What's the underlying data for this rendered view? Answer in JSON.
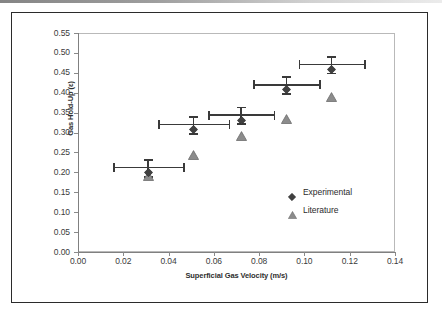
{
  "figure": {
    "frame_color": "#2b2b2b",
    "background": "#ffffff"
  },
  "chart_data": {
    "type": "scatter",
    "title": "",
    "xlabel": "Superficial Gas Velocity (m/s)",
    "ylabel": "Gas Hold-Up (ε)",
    "xlim": [
      0.0,
      0.14
    ],
    "ylim": [
      0.0,
      0.55
    ],
    "xticks": [
      0.0,
      0.02,
      0.04,
      0.06,
      0.08,
      0.1,
      0.12,
      0.14
    ],
    "xtick_labels": [
      "0.00",
      "0.02",
      "0.04",
      "0.06",
      "0.08",
      "0.10",
      "0.12",
      "0.14"
    ],
    "yticks": [
      0.0,
      0.05,
      0.1,
      0.15,
      0.2,
      0.25,
      0.3,
      0.35,
      0.4,
      0.45,
      0.5,
      0.55
    ],
    "ytick_labels": [
      "0.00",
      "0.05",
      "0.10",
      "0.15",
      "0.20",
      "0.25",
      "0.30",
      "0.35",
      "0.40",
      "0.45",
      "0.50",
      "0.55"
    ],
    "grid": false,
    "legend_position": "inside-lower-right",
    "series": [
      {
        "name": "Experimental",
        "marker": "diamond",
        "color": "#404040",
        "x": [
          0.031,
          0.051,
          0.072,
          0.092,
          0.112
        ],
        "y": [
          0.212,
          0.32,
          0.344,
          0.42,
          0.471
        ],
        "xerr": [
          0.0155,
          0.0155,
          0.0145,
          0.0145,
          0.0145
        ],
        "yerr": [
          0.021,
          0.021,
          0.021,
          0.021,
          0.021
        ]
      },
      {
        "name": "Literature",
        "marker": "triangle",
        "color": "#8c8c8c",
        "x": [
          0.031,
          0.051,
          0.072,
          0.092,
          0.112
        ],
        "y": [
          0.2,
          0.254,
          0.302,
          0.344,
          0.399
        ]
      }
    ]
  },
  "legend": {
    "items": [
      {
        "label": "Experimental",
        "marker": "diamond",
        "color": "#404040"
      },
      {
        "label": "Literature",
        "marker": "triangle",
        "color": "#8c8c8c"
      }
    ]
  }
}
